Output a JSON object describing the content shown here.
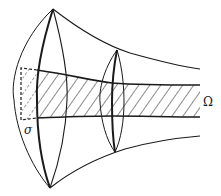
{
  "figure": {
    "labels": {
      "cross_section": "σ",
      "region": "Ω"
    },
    "colors": {
      "stroke": "#1a1a1a",
      "background": "#ffffff"
    }
  }
}
